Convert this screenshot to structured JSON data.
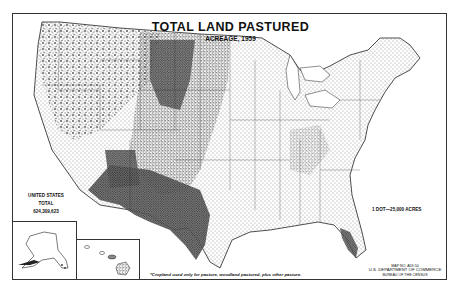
{
  "map": {
    "title": "TOTAL LAND PASTURED",
    "subtitle": "ACREAGE, 1959",
    "type": "dot-density",
    "region": "United States (conterminous) with Alaska and Hawaii insets"
  },
  "summary": {
    "line1": "UNITED STATES",
    "line2": "TOTAL",
    "total_value": "624,309,623"
  },
  "legend": {
    "dot_value": "1 DOT—25,000 ACRES"
  },
  "footnote": "*Cropland used only for pasture, woodland pastured, plus other pasture.",
  "credit": {
    "map_number": "MAP NO. A59-50",
    "department": "U.S. DEPARTMENT OF COMMERCE",
    "bureau": "BUREAU OF THE CENSUS"
  },
  "insets": [
    {
      "name": "Alaska"
    },
    {
      "name": "Hawaii"
    }
  ],
  "colors": {
    "ink": "#111111",
    "border": "#333333",
    "paper": "#ffffff"
  }
}
